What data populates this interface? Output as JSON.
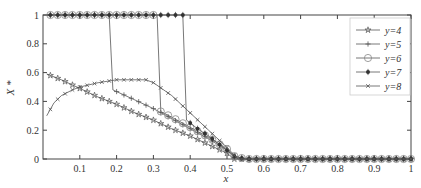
{
  "chart_data": {
    "type": "line",
    "title": "",
    "xlabel": "x",
    "ylabel": "X *",
    "xlim": [
      0,
      1
    ],
    "ylim": [
      0,
      1
    ],
    "x_ticks": [
      "0.1",
      "0.2",
      "0.3",
      "0.4",
      "0.5",
      "0.6",
      "0.7",
      "0.8",
      "0.9",
      "1"
    ],
    "y_ticks": [
      "0",
      "0.2",
      "0.4",
      "0.6",
      "0.8",
      "1"
    ],
    "grid": false,
    "legend_position": "upper right",
    "series": [
      {
        "name": "y=4",
        "marker": "star",
        "x": [
          0.01,
          0.05,
          0.1,
          0.15,
          0.2,
          0.25,
          0.3,
          0.35,
          0.4,
          0.45,
          0.5,
          0.52,
          0.55,
          0.6,
          0.7,
          0.8,
          0.9,
          1.0
        ],
        "y": [
          0.59,
          0.55,
          0.49,
          0.43,
          0.38,
          0.32,
          0.27,
          0.21,
          0.16,
          0.1,
          0.04,
          0.0,
          0.0,
          0.0,
          0.0,
          0.0,
          0.0,
          0.0
        ]
      },
      {
        "name": "y=5",
        "marker": "plus",
        "x": [
          0.01,
          0.05,
          0.1,
          0.15,
          0.18,
          0.19,
          0.25,
          0.3,
          0.35,
          0.4,
          0.45,
          0.5,
          0.52,
          0.55,
          0.6,
          0.7,
          0.8,
          0.9,
          1.0
        ],
        "y": [
          1.0,
          1.0,
          1.0,
          1.0,
          1.0,
          0.48,
          0.41,
          0.35,
          0.28,
          0.21,
          0.14,
          0.06,
          0.01,
          0.0,
          0.0,
          0.0,
          0.0,
          0.0,
          0.0
        ]
      },
      {
        "name": "y=6",
        "marker": "circle",
        "x": [
          0.01,
          0.1,
          0.2,
          0.31,
          0.32,
          0.35,
          0.4,
          0.45,
          0.5,
          0.52,
          0.55,
          0.6,
          0.7,
          0.8,
          0.9,
          1.0
        ],
        "y": [
          1.0,
          1.0,
          1.0,
          1.0,
          0.33,
          0.29,
          0.22,
          0.15,
          0.07,
          0.02,
          0.0,
          0.0,
          0.0,
          0.0,
          0.0,
          0.0
        ]
      },
      {
        "name": "y=7",
        "marker": "filled-circle",
        "x": [
          0.01,
          0.1,
          0.2,
          0.3,
          0.38,
          0.39,
          0.42,
          0.45,
          0.48,
          0.5,
          0.52,
          0.55,
          0.6,
          0.7,
          0.8,
          0.9,
          1.0
        ],
        "y": [
          1.0,
          1.0,
          1.0,
          1.0,
          1.0,
          0.27,
          0.21,
          0.16,
          0.1,
          0.06,
          0.02,
          0.0,
          0.0,
          0.0,
          0.0,
          0.0,
          0.0
        ]
      },
      {
        "name": "y=8",
        "marker": "x",
        "x": [
          0.01,
          0.03,
          0.05,
          0.08,
          0.1,
          0.15,
          0.2,
          0.25,
          0.28,
          0.3,
          0.35,
          0.4,
          0.45,
          0.5,
          0.53,
          0.55,
          0.6,
          0.7,
          0.8,
          0.9,
          1.0
        ],
        "y": [
          0.3,
          0.39,
          0.44,
          0.48,
          0.5,
          0.53,
          0.55,
          0.55,
          0.55,
          0.53,
          0.44,
          0.32,
          0.2,
          0.08,
          0.0,
          0.0,
          0.0,
          0.0,
          0.0,
          0.0,
          0.0
        ]
      }
    ]
  },
  "axes": {
    "x_label": "x",
    "y_label": "X *"
  },
  "legend": {
    "items": [
      {
        "label": "y=4",
        "marker": "star"
      },
      {
        "label": "y=5",
        "marker": "plus"
      },
      {
        "label": "y=6",
        "marker": "circle"
      },
      {
        "label": "y=7",
        "marker": "filled-circle"
      },
      {
        "label": "y=8",
        "marker": "x"
      }
    ]
  },
  "colors": {
    "line": "#555555",
    "axis": "#444444",
    "text": "#333333",
    "legend_border": "#cccccc"
  }
}
